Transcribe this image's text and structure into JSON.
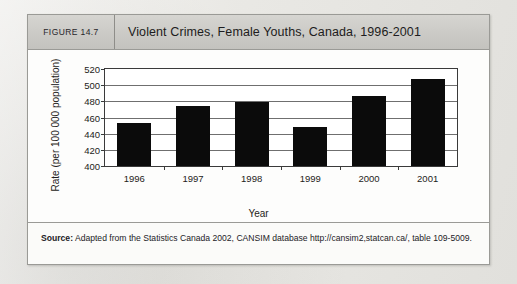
{
  "figure": {
    "number_label": "FIGURE 14.7",
    "title": "Violent Crimes, Female Youths, Canada, 1996-2001"
  },
  "source": {
    "label": "Source:",
    "text": " Adapted from the Statistics Canada 2002, CANSIM database http://cansim2,statcan.ca/, table 109-5009."
  },
  "chart_data": {
    "type": "bar",
    "title": "Violent Crimes, Female Youths, Canada, 1996-2001",
    "xlabel": "Year",
    "ylabel": "Rate (per 100 000 population)",
    "categories": [
      "1996",
      "1997",
      "1998",
      "1999",
      "2000",
      "2001"
    ],
    "values": [
      453,
      474,
      479,
      448,
      487,
      508
    ],
    "ylim": [
      400,
      520
    ],
    "yticks": [
      400,
      420,
      440,
      460,
      480,
      500,
      520
    ],
    "ytick_labels": [
      "400",
      "420",
      "440",
      "460",
      "480",
      "500",
      "520"
    ],
    "grid": true,
    "legend": "none",
    "bar_color": "#0b0b0b"
  }
}
